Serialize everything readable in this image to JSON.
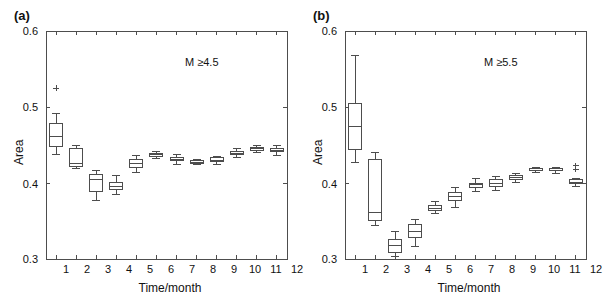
{
  "figure": {
    "background": "#ffffff",
    "line_color": "#4d4d4d",
    "text_color": "#111111"
  },
  "panels": [
    {
      "tag": "(a)",
      "annotation": "M ≥4.5",
      "xlabel": "Time/month",
      "ylabel": "Area",
      "ytick_labels": [
        "0.6",
        "0.5",
        "0.4",
        "0.3"
      ],
      "xtick_labels": [
        "1",
        "2",
        "3",
        "4",
        "5",
        "6",
        "7",
        "8",
        "9",
        "10",
        "11",
        "12"
      ]
    },
    {
      "tag": "(b)",
      "annotation": "M ≥5.5",
      "xlabel": "Time/month",
      "ylabel": "Area",
      "ytick_labels": [
        "0.6",
        "0.5",
        "0.4",
        "0.3"
      ],
      "xtick_labels": [
        "1",
        "2",
        "3",
        "4",
        "5",
        "6",
        "7",
        "8",
        "9",
        "10",
        "11",
        "12"
      ]
    }
  ],
  "chart_data": [
    {
      "type": "box",
      "title": "(a)",
      "annotation": "M ≥4.5",
      "xlabel": "Time/month",
      "ylabel": "Area",
      "ylim": [
        0.3,
        0.6
      ],
      "yticks": [
        0.3,
        0.4,
        0.5,
        0.6
      ],
      "categories": [
        "1",
        "2",
        "3",
        "4",
        "5",
        "6",
        "7",
        "8",
        "9",
        "10",
        "11",
        "12"
      ],
      "grid": false,
      "legend": "none",
      "boxes": [
        {
          "category": "1",
          "whisker_low": 0.437,
          "q1": 0.448,
          "median": 0.461,
          "q3": 0.478,
          "whisker_high": 0.492,
          "outliers": [
            0.525
          ]
        },
        {
          "category": "2",
          "whisker_low": 0.419,
          "q1": 0.422,
          "median": 0.426,
          "q3": 0.446,
          "whisker_high": 0.449,
          "outliers": []
        },
        {
          "category": "3",
          "whisker_low": 0.377,
          "q1": 0.389,
          "median": 0.405,
          "q3": 0.411,
          "whisker_high": 0.416,
          "outliers": []
        },
        {
          "category": "4",
          "whisker_low": 0.385,
          "q1": 0.392,
          "median": 0.396,
          "q3": 0.401,
          "whisker_high": 0.41,
          "outliers": []
        },
        {
          "category": "5",
          "whisker_low": 0.414,
          "q1": 0.421,
          "median": 0.426,
          "q3": 0.431,
          "whisker_high": 0.436,
          "outliers": []
        },
        {
          "category": "6",
          "whisker_low": 0.432,
          "q1": 0.435,
          "median": 0.437,
          "q3": 0.439,
          "whisker_high": 0.441,
          "outliers": []
        },
        {
          "category": "7",
          "whisker_low": 0.425,
          "q1": 0.429,
          "median": 0.431,
          "q3": 0.434,
          "whisker_high": 0.437,
          "outliers": []
        },
        {
          "category": "8",
          "whisker_low": 0.424,
          "q1": 0.426,
          "median": 0.427,
          "q3": 0.429,
          "whisker_high": 0.431,
          "outliers": []
        },
        {
          "category": "9",
          "whisker_low": 0.425,
          "q1": 0.428,
          "median": 0.43,
          "q3": 0.433,
          "whisker_high": 0.435,
          "outliers": []
        },
        {
          "category": "10",
          "whisker_low": 0.433,
          "q1": 0.437,
          "median": 0.439,
          "q3": 0.442,
          "whisker_high": 0.446,
          "outliers": []
        },
        {
          "category": "11",
          "whisker_low": 0.44,
          "q1": 0.443,
          "median": 0.445,
          "q3": 0.447,
          "whisker_high": 0.449,
          "outliers": []
        },
        {
          "category": "12",
          "whisker_low": 0.436,
          "q1": 0.441,
          "median": 0.443,
          "q3": 0.446,
          "whisker_high": 0.45,
          "outliers": []
        }
      ]
    },
    {
      "type": "box",
      "title": "(b)",
      "annotation": "M ≥5.5",
      "xlabel": "Time/month",
      "ylabel": "Area",
      "ylim": [
        0.3,
        0.6
      ],
      "yticks": [
        0.3,
        0.4,
        0.5,
        0.6
      ],
      "categories": [
        "1",
        "2",
        "3",
        "4",
        "5",
        "6",
        "7",
        "8",
        "9",
        "10",
        "11",
        "12"
      ],
      "grid": false,
      "legend": "none",
      "boxes": [
        {
          "category": "1",
          "whisker_low": 0.427,
          "q1": 0.444,
          "median": 0.474,
          "q3": 0.504,
          "whisker_high": 0.568,
          "outliers": []
        },
        {
          "category": "2",
          "whisker_low": 0.344,
          "q1": 0.351,
          "median": 0.361,
          "q3": 0.431,
          "whisker_high": 0.44,
          "outliers": []
        },
        {
          "category": "3",
          "whisker_low": 0.303,
          "q1": 0.309,
          "median": 0.318,
          "q3": 0.326,
          "whisker_high": 0.336,
          "outliers": []
        },
        {
          "category": "4",
          "whisker_low": 0.317,
          "q1": 0.328,
          "median": 0.336,
          "q3": 0.346,
          "whisker_high": 0.352,
          "outliers": []
        },
        {
          "category": "5",
          "whisker_low": 0.36,
          "q1": 0.364,
          "median": 0.367,
          "q3": 0.371,
          "whisker_high": 0.376,
          "outliers": []
        },
        {
          "category": "6",
          "whisker_low": 0.368,
          "q1": 0.377,
          "median": 0.382,
          "q3": 0.388,
          "whisker_high": 0.394,
          "outliers": []
        },
        {
          "category": "7",
          "whisker_low": 0.389,
          "q1": 0.394,
          "median": 0.398,
          "q3": 0.4,
          "whisker_high": 0.406,
          "outliers": []
        },
        {
          "category": "8",
          "whisker_low": 0.39,
          "q1": 0.396,
          "median": 0.399,
          "q3": 0.404,
          "whisker_high": 0.409,
          "outliers": []
        },
        {
          "category": "9",
          "whisker_low": 0.401,
          "q1": 0.405,
          "median": 0.407,
          "q3": 0.41,
          "whisker_high": 0.413,
          "outliers": []
        },
        {
          "category": "10",
          "whisker_low": 0.414,
          "q1": 0.416,
          "median": 0.417,
          "q3": 0.419,
          "whisker_high": 0.42,
          "outliers": []
        },
        {
          "category": "11",
          "whisker_low": 0.413,
          "q1": 0.416,
          "median": 0.417,
          "q3": 0.419,
          "whisker_high": 0.421,
          "outliers": []
        },
        {
          "category": "12",
          "whisker_low": 0.396,
          "q1": 0.399,
          "median": 0.401,
          "q3": 0.404,
          "whisker_high": 0.406,
          "outliers": [
            0.418,
            0.423
          ]
        }
      ]
    }
  ]
}
